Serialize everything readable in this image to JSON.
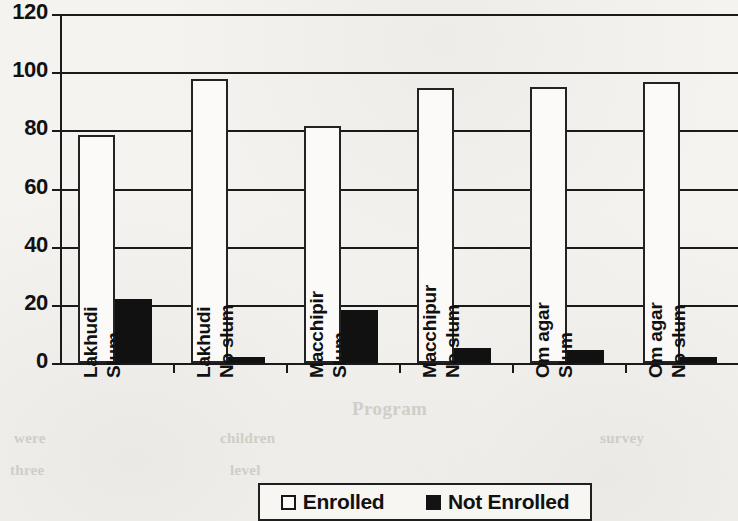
{
  "chart_data": {
    "type": "bar",
    "title": "",
    "xlabel": "",
    "ylabel": "",
    "ylim": [
      0,
      120
    ],
    "yticks": [
      0,
      20,
      40,
      60,
      80,
      100,
      120
    ],
    "ytick_labels": [
      "0",
      "20",
      "40",
      "60",
      "80",
      "100",
      "120"
    ],
    "grid": true,
    "legend_position": "bottom",
    "categories": [
      "Lakhudi Slum",
      "Lakhudi No slum",
      "Macchipir Slum",
      "Macchipur No slum",
      "Om agar Slum",
      "Om agar No slum"
    ],
    "category_lines": [
      [
        "Lakhudi",
        "Slum"
      ],
      [
        "Lakhudi",
        "No slum"
      ],
      [
        "Macchipir",
        "Slum"
      ],
      [
        "Macchipur",
        "No slum"
      ],
      [
        "Om agar",
        "Slum"
      ],
      [
        "Om agar",
        "No slum"
      ]
    ],
    "series": [
      {
        "name": "Enrolled",
        "color": "#ffffff",
        "values": [
          78.3,
          97.5,
          81.4,
          94.7,
          94.8,
          96.5
        ]
      },
      {
        "name": "Not Enrolled",
        "color": "#111111",
        "values": [
          22.0,
          2.0,
          18.3,
          5.0,
          4.5,
          2.0
        ]
      }
    ]
  },
  "legend": {
    "items": [
      {
        "label": "Enrolled",
        "swatch": "open-square-icon"
      },
      {
        "label": "Not Enrolled",
        "swatch": "filled-square-icon"
      }
    ]
  },
  "page_bleed": {
    "a": "Program",
    "b": "children",
    "c": "level",
    "d": "were",
    "e": "three",
    "f": "survey"
  }
}
